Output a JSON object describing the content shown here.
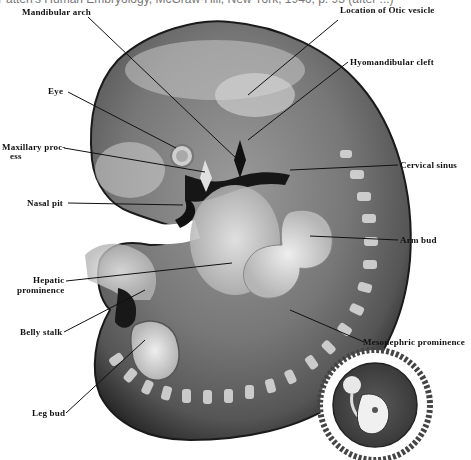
{
  "caption": "Patten's Human Embryology, McGraw-Hill, New York, 1946, p. 93 (after ...)",
  "figure": {
    "labels": [
      {
        "id": "mandibular_arch",
        "text": "Mandibular arch"
      },
      {
        "id": "otic_vesicle",
        "text": "Location of Otic vesicle"
      },
      {
        "id": "eye",
        "text": "Eye"
      },
      {
        "id": "hyomandibular_cleft",
        "text": "Hyomandibular cleft"
      },
      {
        "id": "maxillary_process_1",
        "text": "Maxillary proc-"
      },
      {
        "id": "maxillary_process_2",
        "text": "ess"
      },
      {
        "id": "cervical_sinus",
        "text": "Cervical sinus"
      },
      {
        "id": "nasal_pit",
        "text": "Nasal pit"
      },
      {
        "id": "arm_bud",
        "text": "Arm bud"
      },
      {
        "id": "hepatic_prominence_1",
        "text": "Hepatic"
      },
      {
        "id": "hepatic_prominence_2",
        "text": "prominence"
      },
      {
        "id": "belly_stalk",
        "text": "Belly stalk"
      },
      {
        "id": "mesonephric_prominence",
        "text": "Mesonephric prominence"
      },
      {
        "id": "leg_bud",
        "text": "Leg bud"
      }
    ],
    "inset": "embryo within chorionic sac (inset)"
  }
}
